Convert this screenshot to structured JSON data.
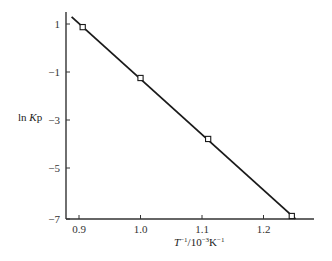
{
  "chart_data": {
    "type": "line",
    "title": "",
    "xlabel": "T⁻¹/10⁻³K⁻¹",
    "ylabel": "ln Kp",
    "xlim": [
      0.88,
      1.33
    ],
    "ylim": [
      -7.1,
      1.5
    ],
    "x_ticks": [
      0.9,
      1.0,
      1.1,
      1.2
    ],
    "x_tick_labels": [
      "0.9",
      "1.0",
      "1.1",
      "1.2"
    ],
    "y_ticks": [
      1,
      -1,
      -3,
      -5,
      -7
    ],
    "y_tick_labels": [
      "1",
      "−1",
      "−3",
      "−5",
      "−7"
    ],
    "grid": false,
    "legend": null,
    "series": [
      {
        "name": "measured",
        "style": "open-square-markers",
        "x": [
          0.906,
          1.0,
          1.11,
          1.246
        ],
        "y": [
          0.87,
          -1.25,
          -3.79,
          -7.0
        ]
      },
      {
        "name": "linear-fit",
        "style": "solid-line",
        "x": [
          0.888,
          1.252
        ],
        "y": [
          1.3,
          -7.12
        ]
      }
    ]
  }
}
